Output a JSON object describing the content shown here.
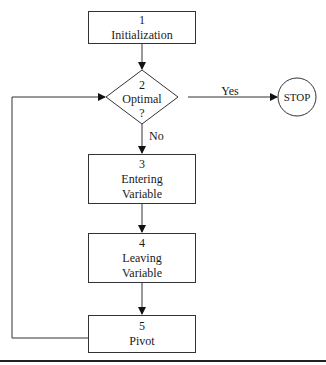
{
  "diagram": {
    "type": "flowchart",
    "nodes": [
      {
        "id": "1",
        "shape": "rectangle",
        "number": "1",
        "line1": "Initialization",
        "line2": ""
      },
      {
        "id": "2",
        "shape": "diamond",
        "number": "2",
        "line1": "Optimal",
        "line2": "?"
      },
      {
        "id": "3",
        "shape": "rectangle",
        "number": "3",
        "line1": "Entering",
        "line2": "Variable"
      },
      {
        "id": "4",
        "shape": "rectangle",
        "number": "4",
        "line1": "Leaving",
        "line2": "Variable"
      },
      {
        "id": "5",
        "shape": "rectangle",
        "number": "5",
        "line1": "Pivot",
        "line2": ""
      },
      {
        "id": "stop",
        "shape": "circle",
        "label": "STOP"
      }
    ],
    "edges": [
      {
        "from": "1",
        "to": "2",
        "label": ""
      },
      {
        "from": "2",
        "to": "stop",
        "label": "Yes"
      },
      {
        "from": "2",
        "to": "3",
        "label": "No"
      },
      {
        "from": "3",
        "to": "4",
        "label": ""
      },
      {
        "from": "4",
        "to": "5",
        "label": ""
      },
      {
        "from": "5",
        "to": "2",
        "label": ""
      }
    ],
    "labels": {
      "yes": "Yes",
      "no": "No",
      "stop": "STOP"
    }
  }
}
